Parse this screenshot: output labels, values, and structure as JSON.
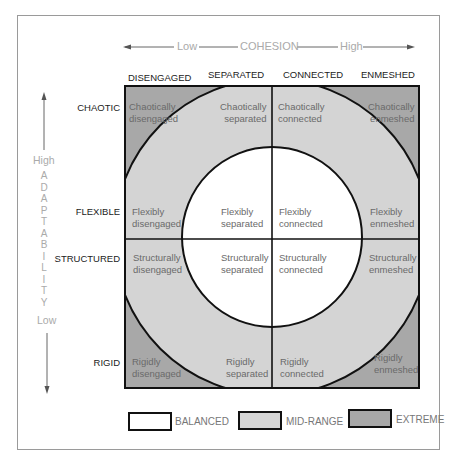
{
  "axes": {
    "cohesion": {
      "title": "COHESION",
      "low": "Low",
      "high": "High"
    },
    "adaptability": {
      "title": "ADAPTABILITY",
      "letters": [
        "A",
        "D",
        "A",
        "P",
        "T",
        "A",
        "B",
        "I",
        "L",
        "I",
        "T",
        "Y"
      ],
      "low": "Low",
      "high": "High"
    }
  },
  "columns": [
    "DISENGAGED",
    "SEPARATED",
    "CONNECTED",
    "ENMESHED"
  ],
  "rows": [
    "CHAOTIC",
    "FLEXIBLE",
    "STRUCTURED",
    "RIGID"
  ],
  "cells": {
    "chaotic": [
      {
        "l1": "Chaotically",
        "l2": "disengaged"
      },
      {
        "l1": "Chaotically",
        "l2": "separated"
      },
      {
        "l1": "Chaotically",
        "l2": "connected"
      },
      {
        "l1": "Chaotically",
        "l2": "enmeshed"
      }
    ],
    "flexible": [
      {
        "l1": "Flexibly",
        "l2": "disengaged"
      },
      {
        "l1": "Flexibly",
        "l2": "separated"
      },
      {
        "l1": "Flexibly",
        "l2": "connected"
      },
      {
        "l1": "Flexibly",
        "l2": "enmeshed"
      }
    ],
    "structured": [
      {
        "l1": "Structurally",
        "l2": "disengaged"
      },
      {
        "l1": "Structurally",
        "l2": "separated"
      },
      {
        "l1": "Structurally",
        "l2": "connected"
      },
      {
        "l1": "Structurally",
        "l2": "enmeshed"
      }
    ],
    "rigid": [
      {
        "l1": "Rigidly",
        "l2": "disengaged"
      },
      {
        "l1": "Rigidly",
        "l2": "separated"
      },
      {
        "l1": "Rigidly",
        "l2": "connected"
      },
      {
        "l1": "Rigidly",
        "l2": "enmeshed"
      }
    ]
  },
  "legend": [
    {
      "label": "BALANCED",
      "color": "#ffffff"
    },
    {
      "label": "MID-RANGE",
      "color": "#d4d4d4"
    },
    {
      "label": "EXTREME",
      "color": "#a8a8a8"
    }
  ],
  "colors": {
    "balanced": "#ffffff",
    "mid_range": "#d4d4d4",
    "extreme": "#a8a8a8",
    "line": "#111111"
  }
}
